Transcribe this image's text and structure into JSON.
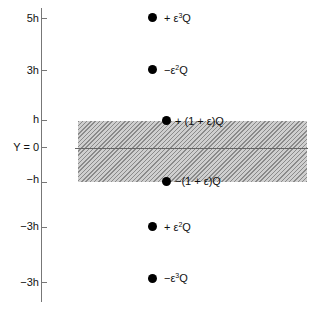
{
  "axis": {
    "ticks": [
      {
        "label": "5h",
        "y": 18
      },
      {
        "label": "3h",
        "y": 70
      },
      {
        "label": "h",
        "y": 120
      },
      {
        "label": "Y = 0",
        "y": 147
      },
      {
        "label": "−h",
        "y": 182
      },
      {
        "label": "−3h",
        "y": 227
      },
      {
        "label": "−3h",
        "y": 282
      }
    ]
  },
  "band": {
    "label": "hatched slab region",
    "top_label": "h",
    "bottom_label": "−h"
  },
  "charges": [
    {
      "sign": "+",
      "pre": "+ ε",
      "exp": "3",
      "post": "Q",
      "y": 18
    },
    {
      "sign": "-",
      "pre": "−ε",
      "exp": "2",
      "post": "Q",
      "y": 70
    },
    {
      "sign": "+",
      "pre": "+ (1 + ε)Q",
      "exp": "",
      "post": "",
      "y": 121
    },
    {
      "sign": "-",
      "pre": "−(1 + ε)Q",
      "exp": "",
      "post": "",
      "y": 182
    },
    {
      "sign": "+",
      "pre": "+ ε",
      "exp": "2",
      "post": "Q",
      "y": 227
    },
    {
      "sign": "-",
      "pre": "−ε",
      "exp": "3",
      "post": "Q",
      "y": 277
    }
  ]
}
